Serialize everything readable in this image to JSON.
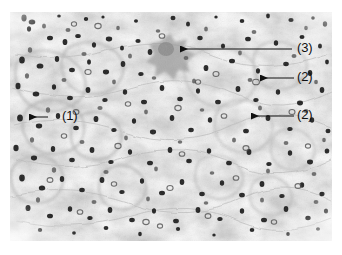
{
  "figure": {
    "type": "histopathology-micrograph",
    "background_color": "#ffffff",
    "plate": {
      "x": 10,
      "y": 12,
      "width": 322,
      "height": 229,
      "fill": "#fefefe",
      "stain_tone": "#6b6b6b",
      "nucleus_color": "#1a1a1a",
      "stroma_color": "#b9b9b9"
    },
    "annotation_color": "#111111",
    "annotations": [
      {
        "id": "annotation-3",
        "label": "(3)",
        "label_x": 297,
        "label_y": 41,
        "line_x1": 292,
        "line_y1": 49,
        "line_x2": 172,
        "line_y2": 49,
        "arrowhead": "left",
        "target": "large pale star-shaped cell cluster"
      },
      {
        "id": "annotation-2a",
        "label": "(2)",
        "label_x": 297,
        "label_y": 70,
        "line_x1": 294,
        "line_y1": 78,
        "line_x2": 252,
        "line_y2": 78,
        "arrowhead": "left",
        "target": "small darkly stained nucleus"
      },
      {
        "id": "annotation-2b",
        "label": "(2)",
        "label_x": 297,
        "label_y": 108,
        "line_x1": 294,
        "line_y1": 116,
        "line_x2": 243,
        "line_y2": 116,
        "arrowhead": "left",
        "target": "clustered dark nuclei"
      },
      {
        "id": "annotation-1",
        "label": "(1)",
        "label_x": 62,
        "label_y": 109,
        "line_x1": 48,
        "line_y1": 117,
        "line_x2": 21,
        "line_y2": 117,
        "arrowhead": "left",
        "target": "pale glandular structure at left"
      }
    ]
  }
}
